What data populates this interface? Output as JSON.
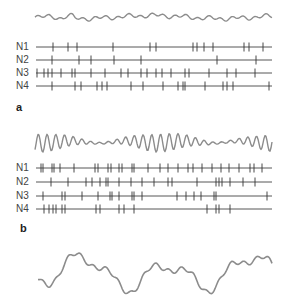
{
  "figure": {
    "colors": {
      "wave": "#8c8c8c",
      "spike": "#333333",
      "baseline": "#444444",
      "label": "#444444"
    },
    "panels": [
      {
        "id": "a",
        "label": "a",
        "label_pos": [
          16,
          101
        ],
        "wave": {
          "y_center": 17,
          "x_start": 35,
          "x_end": 272,
          "type": "low-amplitude-noisy",
          "amp": 2.5,
          "seed": 1
        },
        "rows": [
          {
            "name": "N1",
            "y": 47,
            "spikes": [
              53,
              68,
              77,
              113,
              150,
              156,
              193,
              197,
              204,
              213,
              244,
              249,
              263
            ]
          },
          {
            "name": "N2",
            "y": 60,
            "spikes": [
              52,
              79,
              91,
              114,
              141,
              217,
              256
            ]
          },
          {
            "name": "N3",
            "y": 73,
            "spikes": [
              37,
              44,
              48,
              52,
              61,
              72,
              75,
              91,
              105,
              121,
              128,
              141,
              147,
              156,
              162,
              171,
              185,
              189,
              209,
              227,
              236,
              255
            ]
          },
          {
            "name": "N4",
            "y": 86,
            "spikes": [
              52,
              75,
              81,
              97,
              102,
              107,
              131,
              143,
              163,
              178,
              183,
              185,
              205,
              223,
              227,
              233,
              269
            ]
          }
        ],
        "x_start": 36,
        "x_end": 272
      },
      {
        "id": "b",
        "label": "b",
        "label_pos": [
          20,
          222
        ],
        "wave": {
          "y_center": 142,
          "x_start": 35,
          "x_end": 272,
          "type": "theta-gamma",
          "amp": 9,
          "seed": 2
        },
        "rows": [
          {
            "name": "N1",
            "y": 168,
            "spikes": [
              41,
              43,
              52,
              54,
              60,
              74,
              95,
              98,
              108,
              111,
              119,
              122,
              132,
              134,
              148,
              160,
              168,
              178,
              188,
              193,
              202,
              212,
              221,
              229,
              239,
              250,
              254,
              262
            ]
          },
          {
            "name": "N2",
            "y": 182,
            "spikes": [
              51,
              68,
              86,
              92,
              100,
              106,
              108,
              119,
              131,
              142,
              154,
              168,
              172,
              197,
              216,
              219,
              222,
              230,
              243,
              255
            ]
          },
          {
            "name": "N3",
            "y": 196,
            "spikes": [
              43,
              62,
              65,
              82,
              98,
              110,
              112,
              119,
              132,
              134,
              142,
              177,
              186,
              194,
              201,
              214,
              216,
              267
            ]
          },
          {
            "name": "N4",
            "y": 209,
            "spikes": [
              44,
              49,
              53,
              56,
              62,
              65,
              96,
              100,
              119,
              124,
              134,
              207,
              216,
              219,
              230
            ]
          }
        ],
        "x_start": 36,
        "x_end": 272
      },
      {
        "id": "c",
        "label": "",
        "wave": {
          "y_center": 273,
          "x_start": 38,
          "x_end": 272,
          "type": "large-slow",
          "amp": 18,
          "seed": 3
        },
        "rows": []
      }
    ]
  }
}
